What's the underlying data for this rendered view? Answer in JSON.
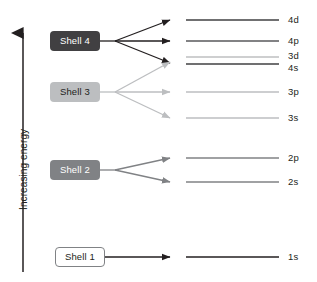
{
  "diagram": {
    "type": "energy-level-diagram",
    "width": 317,
    "height": 282,
    "background": "#ffffff"
  },
  "axis": {
    "label": "Increasing energy",
    "direction": "up",
    "color": "#231f20",
    "arrow_name": "increasing-energy-arrow"
  },
  "palette": {
    "shell1": "#ffffff",
    "shell1_text": "#231f20",
    "shell1_border": "#808285",
    "shell2": "#808285",
    "shell2_text": "#ffffff",
    "shell3": "#bcbec0",
    "shell3_text": "#231f20",
    "shell4": "#414042",
    "shell4_text": "#ffffff",
    "line_dark": "#231f20",
    "line_mid": "#808285",
    "line_light": "#bcbec0",
    "text": "#231f20"
  },
  "shells": [
    {
      "id": "shell-4",
      "label": "Shell 4",
      "fill": "#414042",
      "text_color": "#ffffff",
      "bordered": false,
      "subshells": [
        "4d",
        "4p",
        "4s"
      ]
    },
    {
      "id": "shell-3",
      "label": "Shell 3",
      "fill": "#bcbec0",
      "text_color": "#231f20",
      "bordered": false,
      "subshells": [
        "3d",
        "3p",
        "3s"
      ]
    },
    {
      "id": "shell-2",
      "label": "Shell 2",
      "fill": "#808285",
      "text_color": "#ffffff",
      "bordered": false,
      "subshells": [
        "2p",
        "2s"
      ]
    },
    {
      "id": "shell-1",
      "label": "Shell 1",
      "fill": "#ffffff",
      "text_color": "#231f20",
      "bordered": true,
      "subshells": [
        "1s"
      ]
    }
  ],
  "levels": [
    {
      "id": "level-4d",
      "label": "4d",
      "shell": 4,
      "color": "#414042"
    },
    {
      "id": "level-4p",
      "label": "4p",
      "shell": 4,
      "color": "#58595b"
    },
    {
      "id": "level-3d",
      "label": "3d",
      "shell": 3,
      "color": "#9d9fa2"
    },
    {
      "id": "level-4s",
      "label": "4s",
      "shell": 4,
      "color": "#414042"
    },
    {
      "id": "level-3p",
      "label": "3p",
      "shell": 3,
      "color": "#bcbec0"
    },
    {
      "id": "level-3s",
      "label": "3s",
      "shell": 3,
      "color": "#bcbec0"
    },
    {
      "id": "level-2p",
      "label": "2p",
      "shell": 2,
      "color": "#808285"
    },
    {
      "id": "level-2s",
      "label": "2s",
      "shell": 2,
      "color": "#808285"
    },
    {
      "id": "level-1s",
      "label": "1s",
      "shell": 1,
      "color": "#231f20"
    }
  ]
}
